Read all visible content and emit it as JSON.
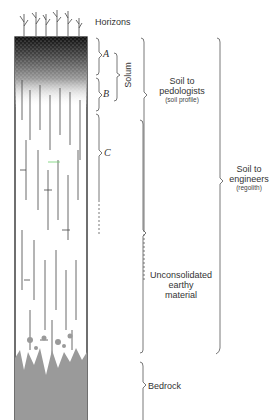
{
  "diagram": {
    "header_label": "Horizons",
    "horizons": [
      {
        "id": "A",
        "label": "A"
      },
      {
        "id": "B",
        "label": "B"
      },
      {
        "id": "C",
        "label": "C"
      }
    ],
    "solum_label": "Solum",
    "pedologists": {
      "title_line1": "Soil to",
      "title_line2": "pedologists",
      "subtitle": "(soil profile)"
    },
    "engineers": {
      "title_line1": "Soil to",
      "title_line2": "engineers",
      "subtitle": "(regolith)"
    },
    "unconsolidated": {
      "line1": "Unconsolidated",
      "line2": "earthy",
      "line3": "material"
    },
    "bedrock_label": "Bedrock",
    "colors": {
      "bedrock": "#9a9a9a",
      "topsoil": "#1a1a1a",
      "lines": "#555555",
      "accent_green": "#6fcf6f"
    }
  }
}
